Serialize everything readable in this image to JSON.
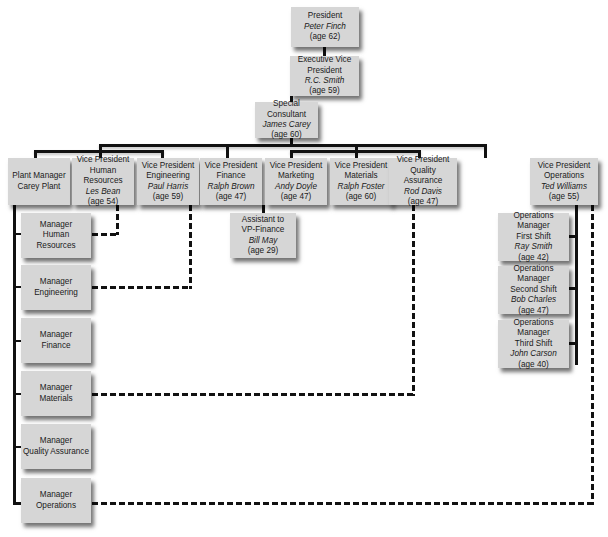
{
  "executive": [
    {
      "id": "president",
      "title": "President",
      "name": "Peter Finch",
      "age": "(age 62)"
    },
    {
      "id": "evp",
      "title": "Executive Vice President",
      "name": "R.C. Smith",
      "age": "(age 59)"
    },
    {
      "id": "consultant",
      "title": "Special Consultant",
      "name": "James Carey",
      "age": "(age 60)"
    }
  ],
  "plant_manager": {
    "title": "Plant Manager",
    "subtitle": "Carey Plant"
  },
  "vice_presidents": [
    {
      "title": "Vice President",
      "dept": "Human Resources",
      "name": "Les Bean",
      "age": "(age 54)"
    },
    {
      "title": "Vice President",
      "dept": "Engineering",
      "name": "Paul Harris",
      "age": "(age 59)"
    },
    {
      "title": "Vice President",
      "dept": "Finance",
      "name": "Ralph Brown",
      "age": "(age 47)"
    },
    {
      "title": "Vice President",
      "dept": "Marketing",
      "name": "Andy Doyle",
      "age": "(age 47)"
    },
    {
      "title": "Vice President",
      "dept": "Materials",
      "name": "Ralph Foster",
      "age": "(age 60)"
    },
    {
      "title": "Vice President",
      "dept": "Quality Assurance",
      "name": "Rod Davis",
      "age": "(age 47)"
    },
    {
      "title": "Vice President",
      "dept": "Operations",
      "name": "Ted Williams",
      "age": "(age 55)"
    }
  ],
  "assistant": {
    "title": "Assistant to",
    "dept": "VP-Finance",
    "name": "Bill May",
    "age": "(age 29)"
  },
  "operations_managers": [
    {
      "title": "Operations Manager",
      "shift": "First Shift",
      "name": "Ray Smith",
      "age": "(age 42)"
    },
    {
      "title": "Operations Manager",
      "shift": "Second Shift",
      "name": "Bob Charles",
      "age": "(age 47)"
    },
    {
      "title": "Operations Manager",
      "shift": "Third Shift",
      "name": "John Carson",
      "age": "(age 40)"
    }
  ],
  "plant_managers": [
    {
      "title": "Manager",
      "dept": "Human Resources"
    },
    {
      "title": "Manager",
      "dept": "Engineering"
    },
    {
      "title": "Manager",
      "dept": "Finance"
    },
    {
      "title": "Manager",
      "dept": "Materials"
    },
    {
      "title": "Manager",
      "dept": "Quality Assurance"
    },
    {
      "title": "Manager",
      "dept": "Operations"
    }
  ],
  "colors": {
    "box_fill": "#d6d6d6",
    "line": "#111111",
    "background": "#ffffff"
  }
}
